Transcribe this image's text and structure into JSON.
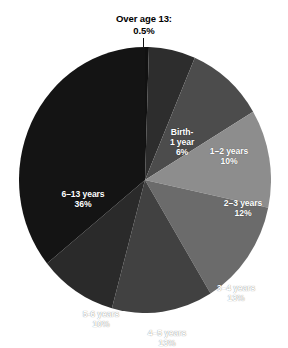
{
  "chart_data": {
    "type": "pie",
    "title": "",
    "subtitle": "",
    "xlabel": "",
    "ylabel": "",
    "legend_position": "none",
    "grid": false,
    "labels_inside_slices": true,
    "start_angle_deg": 0,
    "direction": "clockwise",
    "categories": [
      "Over age 13",
      "Birth-1 year",
      "1–2 years",
      "2–3 years",
      "3–4 years",
      "4–5 years",
      "5-6 years",
      "6–13 years"
    ],
    "values": [
      0.5,
      6,
      10,
      12,
      13,
      13,
      10,
      36
    ],
    "value_labels": [
      "0.5%",
      "6%",
      "10%",
      "12%",
      "13%",
      "13%",
      "10%",
      "36%"
    ],
    "colors": [
      "#111111",
      "#2d2d2d",
      "#4c4c4c",
      "#8d8d8d",
      "#6b6b6b",
      "#414141",
      "#2a2a2a",
      "#141414"
    ],
    "slices": [
      {
        "name": "over-age-13",
        "label": "Over age 13:",
        "value_label": "0.5%",
        "value": 0.5,
        "color": "#111111",
        "label_placement": "callout-top"
      },
      {
        "name": "birth-1-year",
        "label_line_1": "Birth-",
        "label_line_2": "1 year",
        "value_label": "6%",
        "value": 6,
        "color": "#2d2d2d",
        "label_placement": "inside"
      },
      {
        "name": "1-2-years",
        "label": "1–2 years",
        "value_label": "10%",
        "value": 10,
        "color": "#4c4c4c",
        "label_placement": "inside"
      },
      {
        "name": "2-3-years",
        "label": "2–3 years",
        "value_label": "12%",
        "value": 12,
        "color": "#8d8d8d",
        "label_placement": "inside"
      },
      {
        "name": "3-4-years",
        "label": "3–4 years",
        "value_label": "13%",
        "value": 13,
        "color": "#6b6b6b",
        "label_placement": "inside"
      },
      {
        "name": "4-5-years",
        "label": "4–5 years",
        "value_label": "13%",
        "value": 13,
        "color": "#414141",
        "label_placement": "inside"
      },
      {
        "name": "5-6-years",
        "label": "5-6 years",
        "value_label": "10%",
        "value": 10,
        "color": "#2a2a2a",
        "label_placement": "inside"
      },
      {
        "name": "6-13-years",
        "label": "6–13 years",
        "value_label": "36%",
        "value": 36,
        "color": "#141414",
        "label_placement": "inside"
      }
    ]
  },
  "callout": {
    "line_1": "Over age 13:",
    "line_2": "0.5%"
  },
  "labels": {
    "birth_line_1": "Birth-",
    "birth_line_2": "1 year",
    "birth_pct": "6%",
    "y1_2": "1–2 years",
    "y1_2_pct": "10%",
    "y2_3": "2–3 years",
    "y2_3_pct": "12%",
    "y3_4": "3–4 years",
    "y3_4_pct": "13%",
    "y4_5": "4–5 years",
    "y4_5_pct": "13%",
    "y5_6": "5-6 years",
    "y5_6_pct": "10%",
    "y6_13": "6–13 years",
    "y6_13_pct": "36%"
  }
}
